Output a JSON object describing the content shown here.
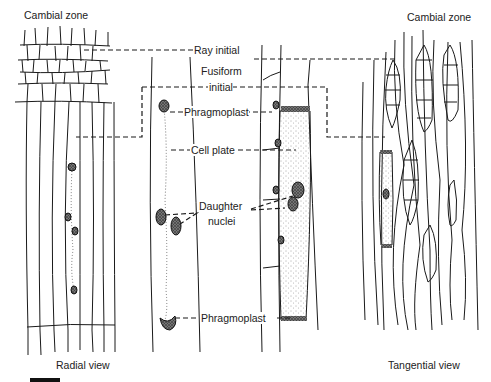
{
  "figure": {
    "top_left_label": "Cambial zone",
    "top_right_label": "Cambial zone",
    "bottom_left_label": "Radial view",
    "bottom_right_label": "Tangential view",
    "annotations": {
      "ray_initial": "Ray initial",
      "fusiform_line1": "Fusiform",
      "fusiform_line2": "initial",
      "phragmoplast_top": "Phragmoplast",
      "cell_plate": "Cell plate",
      "daughter_line1": "Daughter",
      "daughter_line2": "nuclei",
      "phragmoplast_bottom": "Phragmoplast"
    },
    "scale_bar": true
  }
}
